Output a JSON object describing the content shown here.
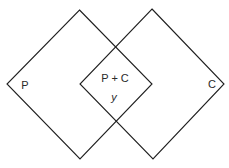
{
  "diagram": {
    "type": "venn-diagram",
    "shape": "diamond",
    "line_color": "#1f1f1f",
    "text_color": "#2a2a2a",
    "sets": [
      {
        "id": "left",
        "label": "P"
      },
      {
        "id": "right",
        "label": "C"
      }
    ],
    "intersection": {
      "label": "P + C",
      "sublabel": "y"
    }
  }
}
